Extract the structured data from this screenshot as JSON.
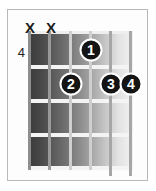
{
  "diagram": {
    "type": "guitar-chord-diagram",
    "title": "",
    "base_fret_label": "4",
    "string_count": 6,
    "fret_count": 4,
    "colors": {
      "dot_fill": "#141414",
      "dot_text": "#ffffff",
      "frame_border": "#b9b9b9",
      "board_dark": "#3a3a3a",
      "board_light": "#f2f2f2",
      "fret_line": "#f4f4f4",
      "string_line": "#9a9a9a",
      "marker_text": "#1d1d1d"
    },
    "string_markers": [
      {
        "string": 1,
        "symbol": "X",
        "name": "mute-marker-string-1"
      },
      {
        "string": 2,
        "symbol": "X",
        "name": "mute-marker-string-2"
      }
    ],
    "fingerings": [
      {
        "finger": "1",
        "string": 4,
        "fret": 1
      },
      {
        "finger": "2",
        "string": 3,
        "fret": 2
      },
      {
        "finger": "3",
        "string": 5,
        "fret": 2
      },
      {
        "finger": "4",
        "string": 6,
        "fret": 2
      }
    ],
    "string_x": [
      30,
      50,
      71,
      91,
      111,
      131
    ],
    "fret_y": [
      33,
      67,
      101,
      135,
      168
    ],
    "marker_y": 27,
    "fret_number_y": 52
  }
}
